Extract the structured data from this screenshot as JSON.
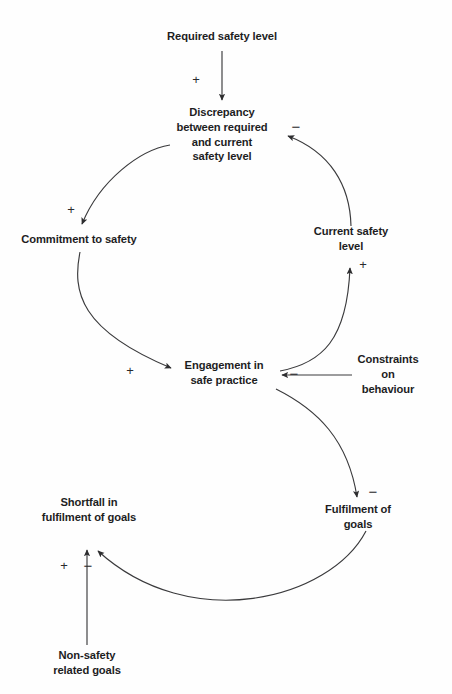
{
  "diagram": {
    "background_color": "#fefefe",
    "line_color": "#3a3a3c",
    "text_color": "#1d1d1f",
    "width": 452,
    "height": 694,
    "nodes": [
      {
        "id": "required-safety-level",
        "label": "Required safety level",
        "x": 222,
        "y": 36
      },
      {
        "id": "discrepancy",
        "label": "Discrepancy\nbetween required\nand current\nsafety level",
        "x": 222,
        "y": 135
      },
      {
        "id": "commitment-to-safety",
        "label": "Commitment to safety",
        "x": 79,
        "y": 239
      },
      {
        "id": "current-safety-level",
        "label": "Current safety level",
        "x": 351,
        "y": 239
      },
      {
        "id": "engagement-in-safe-practice",
        "label": "Engagement in\nsafe practice",
        "x": 224,
        "y": 373
      },
      {
        "id": "constraints-on-behaviour",
        "label": "Constraints on\nbehaviour",
        "x": 388,
        "y": 374
      },
      {
        "id": "shortfall-in-fulfilment-of-goals",
        "label": "Shortfall in\nfulfilment of goals",
        "x": 89,
        "y": 510
      },
      {
        "id": "fulfilment-of-goals",
        "label": "Fulfilment of goals",
        "x": 358,
        "y": 517
      },
      {
        "id": "non-safety-related-goals",
        "label": "Non-safety\nrelated goals",
        "x": 87,
        "y": 663
      }
    ],
    "links": [
      {
        "id": "required-to-discrepancy",
        "from": "required-safety-level",
        "to": "discrepancy",
        "polarity": "+",
        "sign_x": 196,
        "sign_y": 79,
        "path": "M 222 51 L 222 100"
      },
      {
        "id": "discrepancy-to-commitment",
        "from": "discrepancy",
        "to": "commitment-to-safety",
        "polarity": "+",
        "sign_x": 71,
        "sign_y": 209,
        "path": "M 170 145 C 140 150 100 180 82 224"
      },
      {
        "id": "commitment-to-engagement",
        "from": "commitment-to-safety",
        "to": "engagement-in-safe-practice",
        "polarity": "+",
        "sign_x": 130,
        "sign_y": 370,
        "path": "M 80 252 C 72 292 80 330 171 368"
      },
      {
        "id": "engagement-to-current-safety",
        "from": "engagement-in-safe-practice",
        "to": "current-safety-level",
        "polarity": "+",
        "sign_x": 363,
        "sign_y": 264,
        "path": "M 280 371 C 322 363 347 340 350 268"
      },
      {
        "id": "current-safety-to-discrepancy",
        "from": "current-safety-level",
        "to": "discrepancy",
        "polarity": "−",
        "sign_x": 296,
        "sign_y": 126,
        "path": "M 351 226 C 350 185 330 152 288 136"
      },
      {
        "id": "constraints-to-engagement",
        "from": "constraints-on-behaviour",
        "to": "engagement-in-safe-practice",
        "polarity": "−",
        "sign_x": 294,
        "sign_y": 373,
        "path": "M 352 375 L 282 375"
      },
      {
        "id": "engagement-to-fulfilment",
        "from": "engagement-in-safe-practice",
        "to": "fulfilment-of-goals",
        "polarity": "−",
        "sign_x": 373,
        "sign_y": 491,
        "path": "M 276 389 C 318 410 348 440 357 497"
      },
      {
        "id": "fulfilment-to-shortfall",
        "from": "fulfilment-of-goals",
        "to": "shortfall-in-fulfilment-of-goals",
        "polarity": "−",
        "sign_x": 88,
        "sign_y": 565,
        "path": "M 366 531 C 330 600 190 635 98 551"
      },
      {
        "id": "non-safety-goals-to-shortfall",
        "from": "non-safety-related-goals",
        "to": "shortfall-in-fulfilment-of-goals",
        "polarity": "+",
        "sign_x": 64,
        "sign_y": 565,
        "path": "M 87 645 L 87 550"
      }
    ]
  }
}
